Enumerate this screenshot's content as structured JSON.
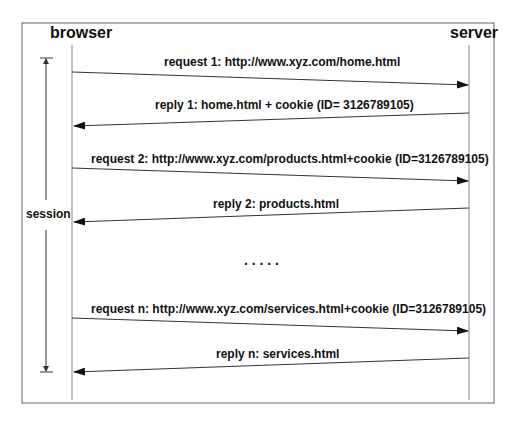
{
  "actors": {
    "left": "browser",
    "right": "server"
  },
  "session": {
    "label": "session"
  },
  "messages": [
    {
      "label": "request 1: http://www.xyz.com/home.html",
      "direction": "browser-to-server"
    },
    {
      "label": "reply 1: home.html + cookie (ID= 3126789105)",
      "direction": "server-to-browser"
    },
    {
      "label": "request 2: http://www.xyz.com/products.html+cookie (ID=3126789105)",
      "direction": "browser-to-server"
    },
    {
      "label": "reply 2: products.html",
      "direction": "server-to-browser"
    },
    {
      "label": "request n: http://www.xyz.com/services.html+cookie (ID=3126789105)",
      "direction": "browser-to-server"
    },
    {
      "label": "reply n: services.html",
      "direction": "server-to-browser"
    }
  ],
  "ellipsis": ". . . . .",
  "colors": {
    "line": "#333333",
    "frame": "#666666",
    "text": "#111111"
  }
}
